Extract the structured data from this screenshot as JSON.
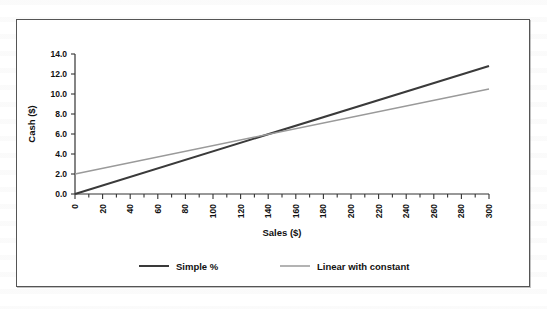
{
  "chart_data": {
    "type": "line",
    "title": "",
    "xlabel": "Sales ($)",
    "ylabel": "Cash ($)",
    "xlim": [
      0,
      300
    ],
    "ylim": [
      0,
      14
    ],
    "xticks": [
      0,
      20,
      40,
      60,
      80,
      100,
      120,
      140,
      160,
      180,
      200,
      220,
      240,
      260,
      280,
      300
    ],
    "xtick_labels": [
      "0",
      "20",
      "40",
      "60",
      "80",
      "100",
      "120",
      "140",
      "160",
      "180",
      "200",
      "220",
      "240",
      "260",
      "280",
      "300"
    ],
    "xminor_step": 10,
    "yticks": [
      0,
      2,
      4,
      6,
      8,
      10,
      12,
      14
    ],
    "ytick_labels": [
      "0.0",
      "2.0",
      "4.0",
      "6.0",
      "8.0",
      "10.0",
      "12.0",
      "14.0"
    ],
    "grid": false,
    "legend_position": "bottom",
    "x": [
      0,
      300
    ],
    "series": [
      {
        "name": "Simple %",
        "color": "#3a3a3a",
        "width": 2.0,
        "values": [
          0.0,
          12.8
        ],
        "intercept": 0.0,
        "slope": 0.04267
      },
      {
        "name": "Linear with constant",
        "color": "#9a9a9a",
        "width": 1.5,
        "values": [
          2.0,
          10.5
        ],
        "intercept": 2.0,
        "slope": 0.02833
      }
    ],
    "intersection": {
      "x": 161,
      "y": 6.9
    }
  },
  "legend": {
    "items": [
      {
        "label": "Simple %",
        "color": "#3a3a3a"
      },
      {
        "label": "Linear with constant",
        "color": "#9a9a9a"
      }
    ]
  },
  "colors": {
    "frame_border": "#555555",
    "axis": "#333333",
    "background": "#ffffff",
    "text": "#111111"
  }
}
